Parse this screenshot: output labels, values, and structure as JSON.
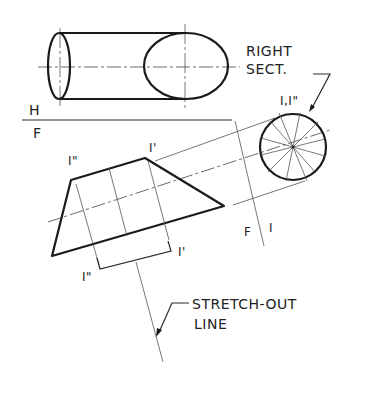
{
  "diagram": {
    "type": "descriptive-geometry-development",
    "labels": {
      "top_view": "H",
      "front_view": "F",
      "right_section_line1": "RIGHT",
      "right_section_line2": "SECT.",
      "right_section_points": "I,I\"",
      "front_aux_fold_left": "F",
      "front_aux_fold_right": "I",
      "point_top_left": "I\"",
      "point_top_right": "I'",
      "point_bottom_left": "I\"",
      "point_bottom_right": "I'",
      "stretch_line1": "STRETCH-OUT",
      "stretch_line2": "LINE"
    },
    "colors": {
      "ink": "#1a1a1a",
      "construction": "#555555",
      "background": "#ffffff"
    }
  }
}
